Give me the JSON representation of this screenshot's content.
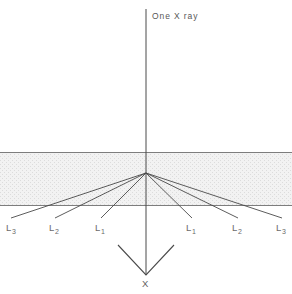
{
  "figure": {
    "title_fragment": "",
    "background_color": "#ffffff",
    "line_color": "#4a4a4a",
    "slab_fill_color": "#ededed",
    "slab_edge_color": "#7a7a7a",
    "label_color": "#5a5a5a"
  },
  "labels": {
    "incident_beam": "One X ray",
    "focus": "X"
  },
  "chart_data": {
    "type": "diagram",
    "title": "One X ray",
    "canvas": {
      "width": 292,
      "height": 294
    },
    "slab": {
      "x": 0,
      "y": 152,
      "width": 292,
      "height": 53,
      "top_y": 152,
      "bottom_y": 205
    },
    "vertex": {
      "x": 146,
      "y": 173
    },
    "incident_beam": {
      "x": 146,
      "y_start": 9,
      "y_end": 275
    },
    "arrowhead": {
      "tip_x": 146,
      "tip_y": 275,
      "left_x": 118,
      "left_y": 245,
      "right_x": 174,
      "right_y": 245
    },
    "rays": [
      {
        "label": "L",
        "subscript": "3",
        "side": "left",
        "end_x": 11,
        "end_y": 218,
        "label_x": 6,
        "label_y": 222
      },
      {
        "label": "L",
        "subscript": "2",
        "side": "left",
        "end_x": 55,
        "end_y": 218,
        "label_x": 49,
        "label_y": 222
      },
      {
        "label": "L",
        "subscript": "1",
        "side": "left",
        "end_x": 101,
        "end_y": 218,
        "label_x": 95,
        "label_y": 222
      },
      {
        "label": "L",
        "subscript": "1",
        "side": "right",
        "end_x": 192,
        "end_y": 218,
        "label_x": 186,
        "label_y": 222
      },
      {
        "label": "L",
        "subscript": "2",
        "side": "right",
        "end_x": 238,
        "end_y": 218,
        "label_x": 232,
        "label_y": 222
      },
      {
        "label": "L",
        "subscript": "3",
        "side": "right",
        "end_x": 282,
        "end_y": 218,
        "label_x": 276,
        "label_y": 222
      }
    ]
  }
}
